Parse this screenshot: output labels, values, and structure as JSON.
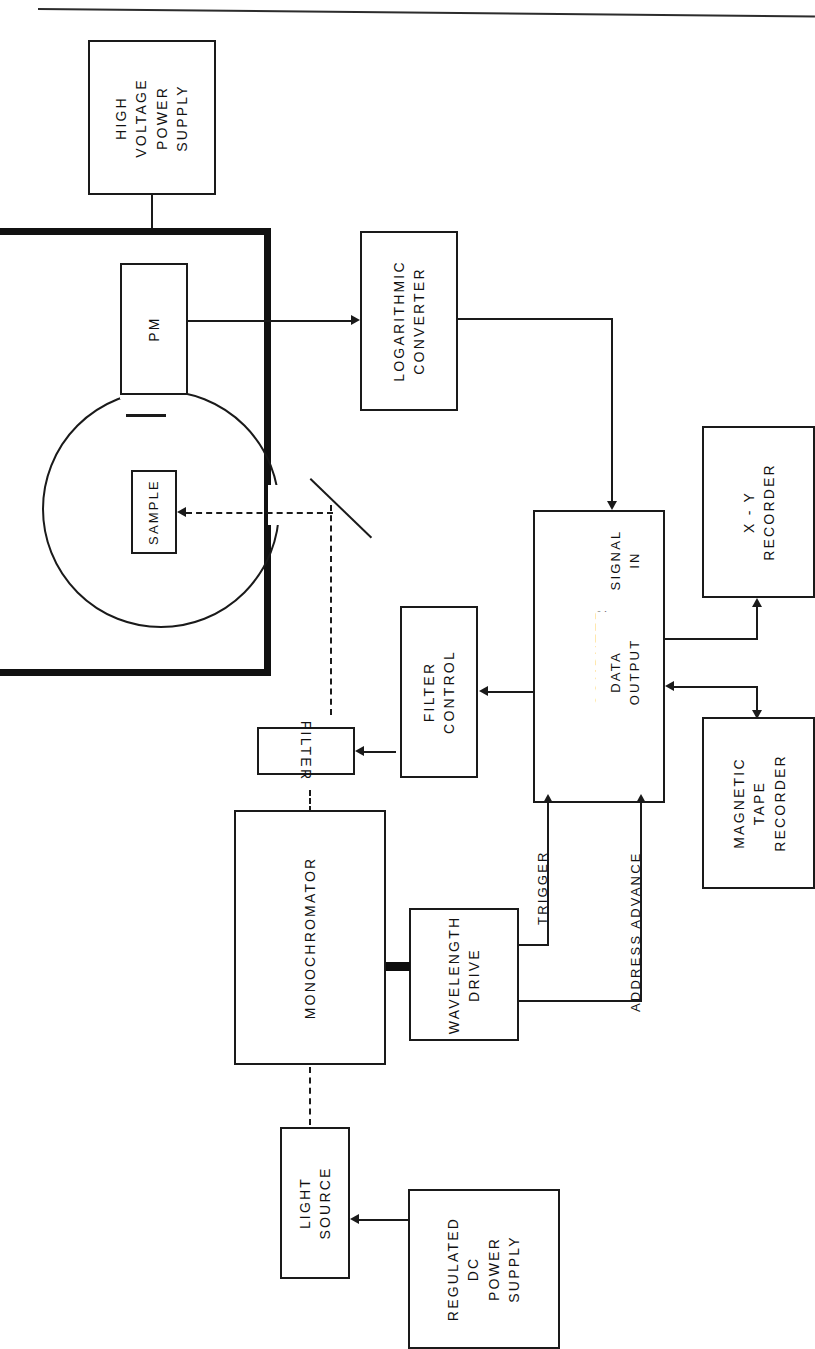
{
  "figure": {
    "kind": "block-diagram",
    "orientation": "rotated-90-ccw"
  },
  "blocks": {
    "hv_power_supply": {
      "lines": [
        "HIGH",
        "VOLTAGE",
        "POWER",
        "SUPPLY"
      ]
    },
    "pm": {
      "lines": [
        "PM"
      ]
    },
    "sample": {
      "lines": [
        "SAMPLE"
      ]
    },
    "log_converter": {
      "lines": [
        "LOGARITHMIC",
        "CONVERTER"
      ]
    },
    "computer": {
      "lines": [
        "COMPUTER"
      ]
    },
    "xy_recorder": {
      "lines": [
        "X - Y",
        "RECORDER"
      ]
    },
    "tape_recorder": {
      "lines": [
        "MAGNETIC",
        "TAPE",
        "RECORDER"
      ]
    },
    "filter_control": {
      "lines": [
        "FILTER",
        "CONTROL"
      ]
    },
    "filter": {
      "lines": [
        "FILTER"
      ]
    },
    "monochromator": {
      "lines": [
        "MONOCHROMATOR"
      ]
    },
    "wavelength_drive": {
      "lines": [
        "WAVELENGTH",
        "DRIVE"
      ]
    },
    "light_source": {
      "lines": [
        "LIGHT",
        "SOURCE"
      ]
    },
    "dc_power_supply": {
      "lines": [
        "REGULATED",
        "DC",
        "POWER",
        "SUPPLY"
      ]
    }
  },
  "port_labels": {
    "signal_in": {
      "lines": [
        "SIGNAL",
        "IN"
      ]
    },
    "data_output": {
      "lines": [
        "DATA",
        "OUTPUT"
      ]
    }
  },
  "line_labels": {
    "trigger": "TRIGGER",
    "address_advance": "ADDRESS ADVANCE"
  },
  "colors": {
    "ink": "#1a1a1a",
    "paper": "#ffffff",
    "chamber_border": "#111111"
  }
}
